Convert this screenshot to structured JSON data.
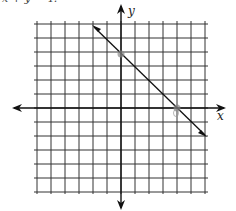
{
  "caption": "x + y = 4.",
  "axes": {
    "x_label": "x",
    "y_label": "y"
  },
  "grid": {
    "x_min": -6,
    "x_max": 6,
    "y_min": -6,
    "y_max": 6,
    "cell_px": 14
  },
  "line": {
    "equation": "x + y = 4",
    "points": [
      {
        "x": 0,
        "y": 4
      },
      {
        "x": 4,
        "y": 0
      }
    ]
  },
  "colors": {
    "grid": "#333333",
    "line": "#111111",
    "point": "#888888"
  }
}
